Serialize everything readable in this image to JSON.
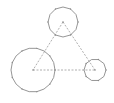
{
  "diagram": {
    "type": "three-circles-triangle",
    "colors": {
      "stroke": "#8a8a8a",
      "dash": "#9a9a9a",
      "background": "#ffffff"
    },
    "circles": [
      {
        "id": "top",
        "cx": 63,
        "cy": 22,
        "r": 15
      },
      {
        "id": "bottom-left",
        "cx": 33,
        "cy": 70,
        "r": 22
      },
      {
        "id": "right",
        "cx": 95,
        "cy": 70,
        "r": 11
      }
    ],
    "edges": [
      {
        "from": "top",
        "to": "bottom-left"
      },
      {
        "from": "top",
        "to": "right"
      },
      {
        "from": "bottom-left",
        "to": "right"
      }
    ]
  }
}
